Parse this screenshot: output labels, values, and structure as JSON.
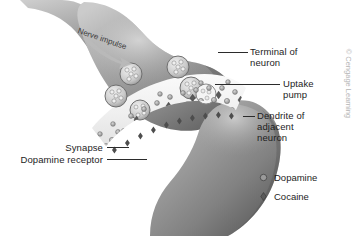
{
  "figure": {
    "background_color": "#ffffff",
    "credit": "© Cengage Learning"
  },
  "annotations": {
    "nerve_impulse": "Nerve impulse"
  },
  "labels": [
    {
      "id": "terminal-of-neuron",
      "text": "Terminal of\nneuron",
      "align": "left"
    },
    {
      "id": "uptake-pump",
      "text": "Uptake\npump",
      "align": "left"
    },
    {
      "id": "dendrite-of-adjacent-neuron",
      "text": "Dendrite of\nadjacent\nneuron",
      "align": "left"
    },
    {
      "id": "synapse",
      "text": "Synapse",
      "align": "right"
    },
    {
      "id": "dopamine-receptor",
      "text": "Dopamine receptor",
      "align": "right"
    }
  ],
  "legend": {
    "items": [
      {
        "id": "dopamine",
        "label": "Dopamine",
        "marker": "circle",
        "color": "#9a9a9a",
        "stroke": "#4a4a4a"
      },
      {
        "id": "cocaine",
        "label": "Cocaine",
        "marker": "diamond",
        "color": "#5a5a5a",
        "stroke": "#3a3a3a"
      }
    ]
  },
  "colors": {
    "neuron_light": "#bdbdbd",
    "neuron_mid": "#9a9a9a",
    "neuron_dark": "#6f6f6f",
    "neuron_edge": "#4f4f4f",
    "cleft": "#f2f2f2",
    "text": "#1d1d1d",
    "leader": "#2b2b2b",
    "credit": "#b4b4b4"
  }
}
